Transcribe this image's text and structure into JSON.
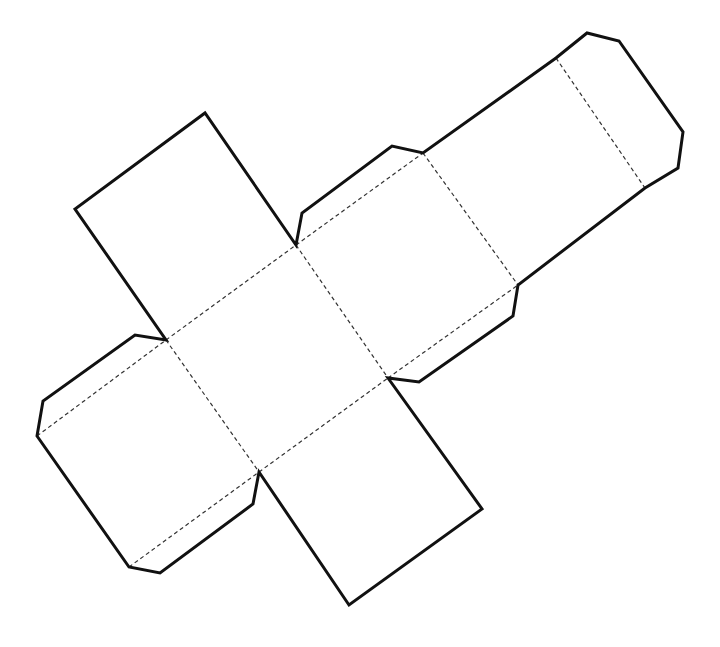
{
  "diagram": {
    "type": "cube-net",
    "colors": {
      "cut_line": "#111111",
      "fold_line": "#333333",
      "background": "#ffffff"
    },
    "outline_points": [
      [
        37,
        436
      ],
      [
        43,
        401
      ],
      [
        135,
        335
      ],
      [
        166,
        340
      ],
      [
        75,
        209
      ],
      [
        205,
        113
      ],
      [
        296,
        245
      ],
      [
        302,
        213
      ],
      [
        392,
        146
      ],
      [
        423,
        153
      ],
      [
        556,
        58
      ],
      [
        587,
        33
      ],
      [
        619,
        41
      ],
      [
        683,
        132
      ],
      [
        678,
        168
      ],
      [
        645,
        188
      ],
      [
        518,
        285
      ],
      [
        513,
        316
      ],
      [
        419,
        382
      ],
      [
        388,
        378
      ],
      [
        482,
        509
      ],
      [
        349,
        605
      ],
      [
        259,
        472
      ],
      [
        253,
        504
      ],
      [
        160,
        573
      ],
      [
        129,
        567
      ],
      [
        37,
        436
      ]
    ],
    "fold_lines": [
      [
        [
          37,
          436
        ],
        [
          166,
          340
        ]
      ],
      [
        [
          166,
          340
        ],
        [
          296,
          245
        ]
      ],
      [
        [
          296,
          245
        ],
        [
          423,
          153
        ]
      ],
      [
        [
          423,
          153
        ],
        [
          556,
          58
        ]
      ],
      [
        [
          129,
          567
        ],
        [
          259,
          472
        ]
      ],
      [
        [
          259,
          472
        ],
        [
          388,
          378
        ]
      ],
      [
        [
          388,
          378
        ],
        [
          518,
          285
        ]
      ],
      [
        [
          518,
          285
        ],
        [
          645,
          188
        ]
      ],
      [
        [
          166,
          340
        ],
        [
          259,
          472
        ]
      ],
      [
        [
          296,
          245
        ],
        [
          388,
          378
        ]
      ],
      [
        [
          423,
          153
        ],
        [
          518,
          285
        ]
      ],
      [
        [
          556,
          58
        ],
        [
          645,
          188
        ]
      ]
    ],
    "faces": [
      {
        "name": "face-left",
        "points": [
          [
            37,
            436
          ],
          [
            166,
            340
          ],
          [
            259,
            472
          ],
          [
            129,
            567
          ]
        ]
      },
      {
        "name": "face-center",
        "points": [
          [
            166,
            340
          ],
          [
            296,
            245
          ],
          [
            388,
            378
          ],
          [
            259,
            472
          ]
        ]
      },
      {
        "name": "face-right-1",
        "points": [
          [
            296,
            245
          ],
          [
            423,
            153
          ],
          [
            518,
            285
          ],
          [
            388,
            378
          ]
        ]
      },
      {
        "name": "face-right-2",
        "points": [
          [
            423,
            153
          ],
          [
            556,
            58
          ],
          [
            645,
            188
          ],
          [
            518,
            285
          ]
        ]
      },
      {
        "name": "face-top",
        "points": [
          [
            75,
            209
          ],
          [
            205,
            113
          ],
          [
            296,
            245
          ],
          [
            166,
            340
          ]
        ]
      },
      {
        "name": "face-bottom",
        "points": [
          [
            259,
            472
          ],
          [
            388,
            378
          ],
          [
            482,
            509
          ],
          [
            349,
            605
          ]
        ]
      }
    ],
    "tabs": [
      {
        "name": "tab-left-top",
        "points": [
          [
            37,
            436
          ],
          [
            43,
            401
          ],
          [
            135,
            335
          ],
          [
            166,
            340
          ]
        ]
      },
      {
        "name": "tab-left-bottom",
        "points": [
          [
            129,
            567
          ],
          [
            160,
            573
          ],
          [
            253,
            504
          ],
          [
            259,
            472
          ]
        ]
      },
      {
        "name": "tab-upper-middle",
        "points": [
          [
            296,
            245
          ],
          [
            302,
            213
          ],
          [
            392,
            146
          ],
          [
            423,
            153
          ]
        ]
      },
      {
        "name": "tab-lower-middle",
        "points": [
          [
            388,
            378
          ],
          [
            419,
            382
          ],
          [
            513,
            316
          ],
          [
            518,
            285
          ]
        ]
      },
      {
        "name": "tab-end",
        "points": [
          [
            556,
            58
          ],
          [
            587,
            33
          ],
          [
            619,
            41
          ],
          [
            683,
            132
          ],
          [
            678,
            168
          ],
          [
            645,
            188
          ]
        ]
      }
    ],
    "label": "Cube net template"
  }
}
